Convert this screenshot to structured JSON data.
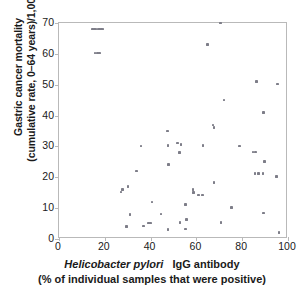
{
  "chart_data": {
    "type": "scatter",
    "title": "",
    "xlabel": "Helicobacter pylori   IgG antibody (% of individual samples that were positive)",
    "ylabel": "Gastric cancer mortality (cumulative rate, 0-64 years)/1,000",
    "xlim": [
      0,
      100
    ],
    "ylim": [
      0,
      70
    ],
    "xticks": [
      0,
      20,
      40,
      60,
      80,
      100
    ],
    "yticks": [
      0,
      10,
      20,
      30,
      40,
      50,
      60,
      70
    ],
    "grid": false,
    "legend": null,
    "marker_color": "#7d7d88",
    "frame_color": "#b9b9b9",
    "points": [
      [
        14.6,
        68.0
      ],
      [
        15.4,
        68.0
      ],
      [
        16.2,
        68.0
      ],
      [
        17.0,
        68.0
      ],
      [
        17.8,
        68.0
      ],
      [
        18.6,
        68.0
      ],
      [
        19.2,
        68.0
      ],
      [
        15.8,
        60.3
      ],
      [
        16.8,
        60.3
      ],
      [
        17.6,
        60.3
      ],
      [
        27.0,
        15.2
      ],
      [
        27.6,
        16.0
      ],
      [
        30.2,
        17.0
      ],
      [
        29.6,
        4.0
      ],
      [
        31.0,
        8.0
      ],
      [
        33.8,
        22.0
      ],
      [
        35.8,
        30.2
      ],
      [
        36.8,
        4.2
      ],
      [
        39.2,
        5.2
      ],
      [
        40.0,
        5.2
      ],
      [
        40.6,
        12.0
      ],
      [
        44.6,
        8.1
      ],
      [
        47.4,
        35.0
      ],
      [
        47.6,
        30.3
      ],
      [
        47.8,
        24.2
      ],
      [
        47.6,
        3.1
      ],
      [
        51.8,
        31.1
      ],
      [
        52.6,
        28.0
      ],
      [
        53.2,
        30.6
      ],
      [
        52.8,
        5.4
      ],
      [
        55.2,
        11.2
      ],
      [
        55.8,
        6.4
      ],
      [
        55.2,
        3.2
      ],
      [
        58.6,
        16.1
      ],
      [
        58.8,
        15.0
      ],
      [
        60.8,
        14.2
      ],
      [
        62.6,
        14.2
      ],
      [
        62.8,
        30.3
      ],
      [
        64.8,
        63.1
      ],
      [
        67.2,
        37.0
      ],
      [
        67.6,
        36.2
      ],
      [
        67.6,
        18.3
      ],
      [
        70.4,
        70.0
      ],
      [
        70.8,
        5.4
      ],
      [
        72.0,
        45.0
      ],
      [
        75.4,
        10.2
      ],
      [
        78.8,
        30.2
      ],
      [
        84.8,
        28.2
      ],
      [
        85.8,
        28.2
      ],
      [
        86.2,
        51.0
      ],
      [
        85.6,
        21.2
      ],
      [
        87.0,
        21.2
      ],
      [
        89.0,
        21.2
      ],
      [
        89.4,
        41.0
      ],
      [
        89.8,
        25.2
      ],
      [
        89.4,
        8.4
      ],
      [
        95.4,
        50.2
      ],
      [
        95.0,
        20.2
      ],
      [
        96.0,
        2.2
      ]
    ]
  },
  "axes": {
    "y_title_line1": "Gastric cancer mortality",
    "y_title_line2": "(cumulative rate, 0–64 years)/1,000",
    "x_title_italic": "Helicobacter pylori",
    "x_title_rest": "IgG antibody",
    "x_subtitle": "(% of individual samples that were positive)",
    "ytick_labels": [
      "70",
      "60",
      "50",
      "40",
      "30",
      "20",
      "10",
      "0"
    ],
    "xtick_labels": [
      "0",
      "20",
      "40",
      "60",
      "80",
      "100"
    ]
  }
}
